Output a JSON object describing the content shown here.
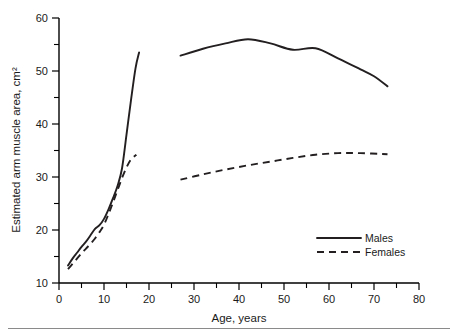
{
  "chart_data": {
    "type": "line",
    "title": "",
    "xlabel": "Age, years",
    "ylabel": "Estimated arm muscle area, cm²",
    "xlim": [
      0,
      80
    ],
    "ylim": [
      10,
      60
    ],
    "xticks": [
      0,
      10,
      20,
      30,
      40,
      50,
      60,
      70,
      80
    ],
    "xtick_labels": [
      "0",
      "10",
      "20",
      "30",
      "40",
      "50",
      "60",
      "70",
      "80"
    ],
    "xticks_minor": [
      5,
      15,
      25,
      35,
      45,
      55,
      65,
      75
    ],
    "yticks": [
      10,
      20,
      30,
      40,
      50,
      60
    ],
    "ytick_labels": [
      "10",
      "20",
      "30",
      "40",
      "50",
      "60"
    ],
    "yticks_minor": [
      15,
      25,
      35,
      45,
      55
    ],
    "grid": false,
    "legend_position": "lower right",
    "series": [
      {
        "name": "Males",
        "style": "solid",
        "color": "#231f20",
        "segments": [
          {
            "label": "children-adolescents",
            "points": [
              [
                2.0,
                13.3
              ],
              [
                3.0,
                14.6
              ],
              [
                4.0,
                15.7
              ],
              [
                5.0,
                16.8
              ],
              [
                6.0,
                17.8
              ],
              [
                7.0,
                19.0
              ],
              [
                8.0,
                20.2
              ],
              [
                9.0,
                20.9
              ],
              [
                10.0,
                22.1
              ],
              [
                11.0,
                23.9
              ],
              [
                12.0,
                26.0
              ],
              [
                13.0,
                28.3
              ],
              [
                14.0,
                31.6
              ],
              [
                15.0,
                38.0
              ],
              [
                16.0,
                44.5
              ],
              [
                17.0,
                50.5
              ],
              [
                17.8,
                53.5
              ]
            ]
          },
          {
            "label": "adults",
            "points": [
              [
                27.0,
                52.9
              ],
              [
                32.0,
                54.2
              ],
              [
                37.0,
                55.2
              ],
              [
                42.0,
                56.0
              ],
              [
                47.0,
                55.2
              ],
              [
                52.0,
                54.0
              ],
              [
                57.0,
                54.3
              ],
              [
                62.0,
                52.4
              ],
              [
                67.0,
                50.3
              ],
              [
                70.0,
                49.0
              ],
              [
                73.0,
                47.1
              ]
            ]
          }
        ]
      },
      {
        "name": "Females",
        "style": "dashed",
        "color": "#231f20",
        "segments": [
          {
            "label": "children-adolescents",
            "points": [
              [
                2.0,
                12.6
              ],
              [
                3.0,
                13.6
              ],
              [
                4.0,
                14.6
              ],
              [
                5.0,
                15.6
              ],
              [
                6.0,
                16.5
              ],
              [
                7.0,
                17.4
              ],
              [
                8.0,
                18.4
              ],
              [
                9.0,
                19.6
              ],
              [
                10.0,
                21.0
              ],
              [
                11.0,
                23.0
              ],
              [
                12.0,
                25.2
              ],
              [
                13.0,
                27.5
              ],
              [
                14.0,
                29.8
              ],
              [
                15.0,
                31.8
              ],
              [
                16.0,
                33.3
              ],
              [
                17.2,
                34.2
              ]
            ]
          },
          {
            "label": "adults",
            "points": [
              [
                27.0,
                29.5
              ],
              [
                32.0,
                30.5
              ],
              [
                37.0,
                31.4
              ],
              [
                42.0,
                32.2
              ],
              [
                47.0,
                32.9
              ],
              [
                52.0,
                33.6
              ],
              [
                57.0,
                34.2
              ],
              [
                62.0,
                34.5
              ],
              [
                67.0,
                34.5
              ],
              [
                73.0,
                34.3
              ]
            ]
          }
        ]
      }
    ],
    "legend": [
      {
        "label": "Males",
        "style": "solid"
      },
      {
        "label": "Females",
        "style": "dashed"
      }
    ]
  }
}
